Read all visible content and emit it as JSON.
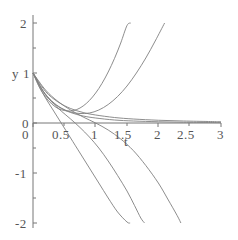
{
  "chart_data": {
    "type": "line",
    "title": "",
    "xlabel": "t",
    "ylabel": "y",
    "xlim": [
      0,
      3
    ],
    "ylim": [
      -2,
      2
    ],
    "grid": false,
    "legend": false,
    "x_ticks": [
      0,
      0.5,
      1,
      1.5,
      2,
      2.5,
      3
    ],
    "x_tick_labels": [
      "0",
      "0.5",
      "1",
      "1.5",
      "2",
      "2.5",
      "3"
    ],
    "y_ticks": [
      2,
      1,
      0,
      -1,
      -2
    ],
    "y_tick_labels": [
      "2",
      "1",
      "0",
      "-1",
      "-2"
    ],
    "line_color": "#808080",
    "axis_color": "#777777",
    "text_color": "#555555",
    "background": "#ffffff",
    "series": [
      {
        "name": "curve-1-parabolic-steep",
        "points": [
          [
            0,
            1
          ],
          [
            0.1,
            0.72
          ],
          [
            0.2,
            0.52
          ],
          [
            0.3,
            0.38
          ],
          [
            0.4,
            0.29
          ],
          [
            0.5,
            0.25
          ],
          [
            0.6,
            0.24
          ],
          [
            0.7,
            0.27
          ],
          [
            0.8,
            0.34
          ],
          [
            0.9,
            0.45
          ],
          [
            1.0,
            0.6
          ],
          [
            1.1,
            0.79
          ],
          [
            1.2,
            1.02
          ],
          [
            1.3,
            1.29
          ],
          [
            1.4,
            1.6
          ],
          [
            1.5,
            1.95
          ],
          [
            1.56,
            2.0
          ]
        ]
      },
      {
        "name": "curve-2-parabolic-wide",
        "points": [
          [
            0,
            1
          ],
          [
            0.15,
            0.66
          ],
          [
            0.3,
            0.44
          ],
          [
            0.45,
            0.3
          ],
          [
            0.6,
            0.22
          ],
          [
            0.75,
            0.19
          ],
          [
            0.9,
            0.2
          ],
          [
            1.05,
            0.26
          ],
          [
            1.2,
            0.37
          ],
          [
            1.35,
            0.53
          ],
          [
            1.5,
            0.74
          ],
          [
            1.65,
            1.0
          ],
          [
            1.8,
            1.3
          ],
          [
            1.95,
            1.64
          ],
          [
            2.1,
            2.0
          ]
        ]
      },
      {
        "name": "curve-3-decay-fast",
        "points": [
          [
            0,
            1
          ],
          [
            0.2,
            0.56
          ],
          [
            0.4,
            0.33
          ],
          [
            0.6,
            0.21
          ],
          [
            0.8,
            0.14
          ],
          [
            1.0,
            0.1
          ],
          [
            1.3,
            0.06
          ],
          [
            1.6,
            0.04
          ],
          [
            2.0,
            0.025
          ],
          [
            2.4,
            0.015
          ],
          [
            2.8,
            0.01
          ],
          [
            3.0,
            0.008
          ]
        ]
      },
      {
        "name": "curve-4-decay-slow",
        "points": [
          [
            0,
            1
          ],
          [
            0.2,
            0.63
          ],
          [
            0.4,
            0.42
          ],
          [
            0.6,
            0.29
          ],
          [
            0.8,
            0.21
          ],
          [
            1.0,
            0.16
          ],
          [
            1.3,
            0.11
          ],
          [
            1.6,
            0.08
          ],
          [
            2.0,
            0.055
          ],
          [
            2.4,
            0.04
          ],
          [
            2.8,
            0.03
          ],
          [
            3.0,
            0.025
          ]
        ]
      },
      {
        "name": "curve-5-descend-steepest",
        "points": [
          [
            0,
            1
          ],
          [
            0.1,
            0.73
          ],
          [
            0.2,
            0.5
          ],
          [
            0.3,
            0.3
          ],
          [
            0.4,
            0.1
          ],
          [
            0.5,
            -0.1
          ],
          [
            0.6,
            -0.3
          ],
          [
            0.75,
            -0.6
          ],
          [
            0.9,
            -0.9
          ],
          [
            1.05,
            -1.2
          ],
          [
            1.2,
            -1.5
          ],
          [
            1.35,
            -1.78
          ],
          [
            1.5,
            -1.98
          ],
          [
            1.55,
            -2.0
          ]
        ]
      },
      {
        "name": "curve-6-descend-mid",
        "points": [
          [
            0,
            1
          ],
          [
            0.15,
            0.66
          ],
          [
            0.3,
            0.42
          ],
          [
            0.45,
            0.24
          ],
          [
            0.6,
            0.08
          ],
          [
            0.75,
            -0.09
          ],
          [
            0.9,
            -0.28
          ],
          [
            1.05,
            -0.5
          ],
          [
            1.2,
            -0.76
          ],
          [
            1.35,
            -1.05
          ],
          [
            1.5,
            -1.36
          ],
          [
            1.62,
            -1.65
          ],
          [
            1.72,
            -1.9
          ],
          [
            1.78,
            -2.0
          ]
        ]
      },
      {
        "name": "curve-7-descend-shallow",
        "points": [
          [
            0,
            1
          ],
          [
            0.2,
            0.66
          ],
          [
            0.4,
            0.43
          ],
          [
            0.6,
            0.26
          ],
          [
            0.8,
            0.12
          ],
          [
            1.0,
            0.0
          ],
          [
            1.2,
            -0.14
          ],
          [
            1.4,
            -0.32
          ],
          [
            1.6,
            -0.55
          ],
          [
            1.8,
            -0.85
          ],
          [
            2.0,
            -1.2
          ],
          [
            2.15,
            -1.52
          ],
          [
            2.3,
            -1.85
          ],
          [
            2.36,
            -2.0
          ]
        ]
      }
    ]
  },
  "axis_labels": {
    "y_name": "y",
    "x_name": "t"
  }
}
